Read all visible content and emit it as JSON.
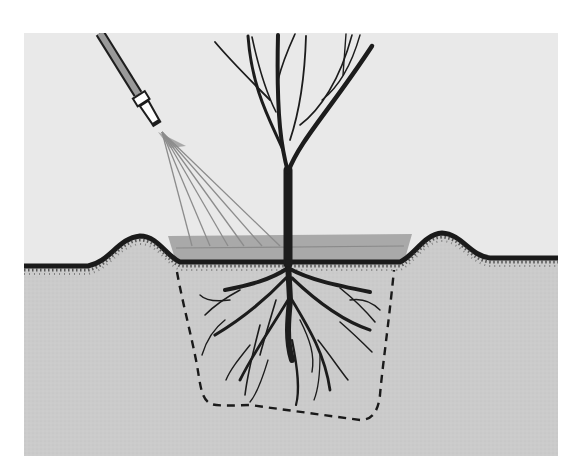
{
  "illustration": {
    "subject": "Watering a newly planted bare-root tree",
    "elements": [
      "garden-hose-with-nozzle",
      "water-spray",
      "bare-tree",
      "water-basin",
      "soil-berm-left",
      "soil-berm-right",
      "root-system",
      "planting-hole-outline"
    ]
  },
  "colors": {
    "sky": "#e9e9e9",
    "soil": "#cbcbcb",
    "soil_edge": "#1a1a1a",
    "water": "#a9a9a9",
    "water_line": "#8a8a8a",
    "hose": "#9a9a9a",
    "tree": "#1c1c1c",
    "spray": "#8c8c8c",
    "hole_outline": "#1a1a1a",
    "background": "#ffffff"
  }
}
